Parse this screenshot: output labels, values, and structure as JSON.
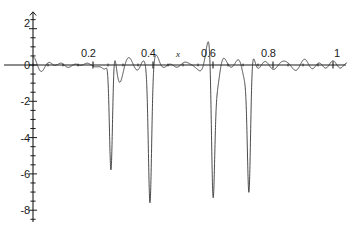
{
  "chart_data": {
    "type": "line",
    "title": "",
    "subtitle": "",
    "xlabel": "x",
    "ylabel": "",
    "xlim": [
      0,
      1.04
    ],
    "ylim": [
      -8.7,
      2.6
    ],
    "grid": false,
    "legend": null,
    "x_ticks_labeled": [
      {
        "value": 0.2,
        "label": "0.2"
      },
      {
        "value": 0.4,
        "label": "0.4"
      },
      {
        "value": 0.6,
        "label": "0.6"
      },
      {
        "value": 0.8,
        "label": "0.8"
      },
      {
        "value": 1.0,
        "label": "1"
      }
    ],
    "x_tick_step_minor": 0.025,
    "y_ticks_labeled": [
      {
        "value": 2,
        "label": "2"
      },
      {
        "value": 0,
        "label": "0"
      },
      {
        "value": -2,
        "label": "-2"
      },
      {
        "value": -4,
        "label": "-4"
      },
      {
        "value": -6,
        "label": "-6"
      },
      {
        "value": -8,
        "label": "-8"
      }
    ],
    "y_tick_step_minor": 0.5,
    "line_color": "#2b2b2b",
    "axis_color": "#1a1a1a",
    "background_color": "#ffffff",
    "series": [
      {
        "name": "f(x)",
        "formula_terms": [
          {
            "amplitude": 1.0,
            "frequency_cycles": 22,
            "phase": 0
          },
          {
            "amplitude": 1.0,
            "frequency_cycles": 19,
            "phase": 0
          },
          {
            "amplitude": 1.0,
            "frequency_cycles": 15.5,
            "phase": 0
          },
          {
            "amplitude": 1.0,
            "frequency_cycles": 12,
            "phase": 0
          }
        ],
        "envelope_note": "carrier beating produces 4 constructive minima",
        "max_value": 2.45,
        "min_value": -8.35,
        "negative_spike_x": [
          0.26,
          0.39,
          0.6,
          0.72
        ],
        "negative_spike_y": [
          -8.3,
          -8.35,
          -8.3,
          -8.35
        ],
        "positive_peak_x": [
          0.255,
          0.385,
          0.5,
          0.595,
          0.725
        ],
        "positive_peak_y": [
          1.95,
          2.4,
          0.95,
          2.45,
          1.95
        ]
      }
    ]
  },
  "axis_annotations": {
    "x_axis_name": "x"
  }
}
